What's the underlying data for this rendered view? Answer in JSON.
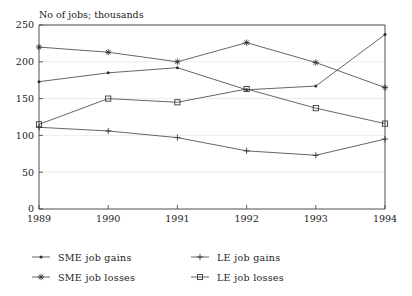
{
  "chart_data": {
    "type": "line",
    "title": "No of jobs; thousands",
    "xlabel": "",
    "ylabel": "",
    "categories": [
      "1989",
      "1990",
      "1991",
      "1992",
      "1993",
      "1994"
    ],
    "x": [
      1989,
      1990,
      1991,
      1992,
      1993,
      1994
    ],
    "xlim": [
      1989,
      1994
    ],
    "ylim": [
      0,
      250
    ],
    "y_ticks": [
      0,
      50,
      100,
      150,
      200,
      250
    ],
    "x_ticks": [
      "1989",
      "1990",
      "1991",
      "1992",
      "1993",
      "1994"
    ],
    "grid": true,
    "legend_position": "bottom",
    "series": [
      {
        "name": "SME job gains",
        "marker": "dot",
        "values": [
          173,
          185,
          192,
          162,
          167,
          237
        ]
      },
      {
        "name": "LE job gains",
        "marker": "plus",
        "values": [
          111,
          106,
          97,
          79,
          73,
          95
        ]
      },
      {
        "name": "SME job losses",
        "marker": "asterisk",
        "values": [
          220,
          213,
          200,
          226,
          199,
          165
        ]
      },
      {
        "name": "LE job losses",
        "marker": "square",
        "values": [
          115,
          150,
          145,
          163,
          137,
          116
        ]
      }
    ]
  },
  "legend": {
    "entries": [
      {
        "label": "SME job gains",
        "marker": "dot"
      },
      {
        "label": "LE job gains",
        "marker": "plus"
      },
      {
        "label": "SME job losses",
        "marker": "asterisk"
      },
      {
        "label": "LE job losses",
        "marker": "square"
      }
    ]
  },
  "colors": {
    "line": "#4a4a4a",
    "axis": "#3a3a3a",
    "grid": "#d8d8d8",
    "text": "#1a1a1a",
    "background": "#ffffff"
  }
}
